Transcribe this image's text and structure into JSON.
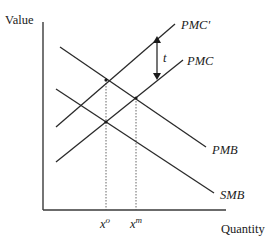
{
  "diagram": {
    "type": "supply-demand-externality",
    "axes": {
      "y_label": "Value",
      "x_label": "Quantity"
    },
    "curves": [
      {
        "id": "pmc_prime",
        "label": "PMC'",
        "kind": "upward",
        "from": [
          56,
          127
        ],
        "to": [
          175,
          24
        ]
      },
      {
        "id": "pmc",
        "label": "PMC",
        "kind": "upward",
        "from": [
          56,
          162
        ],
        "to": [
          183,
          60
        ]
      },
      {
        "id": "pmb",
        "label": "PMB",
        "kind": "downward",
        "from": [
          60,
          47
        ],
        "to": [
          206,
          147
        ]
      },
      {
        "id": "smb",
        "label": "SMB",
        "kind": "downward",
        "from": [
          56,
          89
        ],
        "to": [
          214,
          193
        ]
      }
    ],
    "tax": {
      "label": "t",
      "x": 157,
      "y_top": 37,
      "y_bottom": 79
    },
    "quantities": [
      {
        "id": "x_o",
        "base": "x",
        "sup": "o",
        "x": 106,
        "y_top": 80
      },
      {
        "id": "x_m",
        "base": "x",
        "sup": "m",
        "x": 136,
        "y_top": 98
      }
    ],
    "intersections": [
      {
        "x": 106,
        "y": 80
      },
      {
        "x": 106,
        "y": 122
      },
      {
        "x": 136,
        "y": 98
      },
      {
        "x": 75,
        "y": 102
      }
    ]
  }
}
